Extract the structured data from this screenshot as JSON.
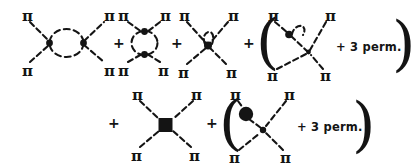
{
  "figure": {
    "kind": "feynman-diagram-equation",
    "background_color": "#ffffff",
    "ink_color": "#141414",
    "line_style": "dashed",
    "particle_label": "π",
    "plus_sign": "+",
    "perm_label": "+ 3 perm.",
    "open_paren": "(",
    "close_paren": ")",
    "rows": [
      {
        "id": "row-1",
        "terms": [
          {
            "id": "term-1",
            "name": "horizontal-bubble-loop-diagram",
            "vertices": 2,
            "loop": "horizontal-bubble",
            "external_legs": 4,
            "leg_labels": [
              "π",
              "π",
              "π",
              "π"
            ]
          },
          {
            "id": "term-2",
            "name": "vertical-bubble-loop-diagram",
            "vertices": 2,
            "loop": "vertical-bubble",
            "external_legs": 4,
            "leg_labels": [
              "π",
              "π",
              "π",
              "π"
            ]
          },
          {
            "id": "term-3",
            "name": "tadpole-on-vertex-diagram",
            "vertices": 1,
            "loop": "self-loop-tadpole",
            "external_legs": 4,
            "leg_labels": [
              "π",
              "π",
              "π",
              "π"
            ]
          },
          {
            "id": "term-4",
            "name": "tadpole-on-leg-diagram",
            "vertices": 2,
            "loop": "self-loop-on-external-leg",
            "external_legs": 4,
            "leg_labels": [
              "π",
              "π",
              "π",
              "π"
            ],
            "grouped": true,
            "group_note": "+ 3 perm."
          }
        ]
      },
      {
        "id": "row-2",
        "terms": [
          {
            "id": "term-5",
            "name": "square-vertex-contact-diagram",
            "vertices": 1,
            "vertex_shape": "filled-square",
            "external_legs": 4,
            "leg_labels": [
              "π",
              "π",
              "π",
              "π"
            ]
          },
          {
            "id": "term-6",
            "name": "blob-insertion-on-leg-diagram",
            "vertices": 1,
            "vertex_shape": "filled-dot",
            "insertion_shape": "filled-circle-blob",
            "external_legs": 4,
            "leg_labels": [
              "π",
              "π",
              "π",
              "π"
            ],
            "grouped": true,
            "group_note": "+ 3 perm."
          }
        ]
      }
    ]
  }
}
